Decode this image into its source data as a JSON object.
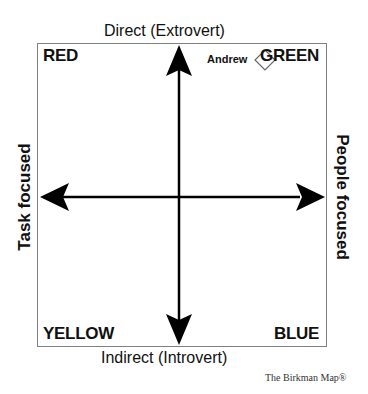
{
  "diagram": {
    "title_top": "Direct (Extrovert)",
    "title_bottom": "Indirect (Introvert)",
    "title_left": "Task focused",
    "title_right": "People focused",
    "quadrants": {
      "top_left": "RED",
      "top_right": "GREEN",
      "bottom_left": "YELLOW",
      "bottom_right": "BLUE"
    },
    "marker": {
      "label": "Andrew",
      "shape": "diamond-icon",
      "quadrant": "top_right"
    },
    "footer": "The Birkman Map®",
    "colors": {
      "frame": "#808080",
      "arrows": "#000000",
      "text": "#111111"
    }
  }
}
